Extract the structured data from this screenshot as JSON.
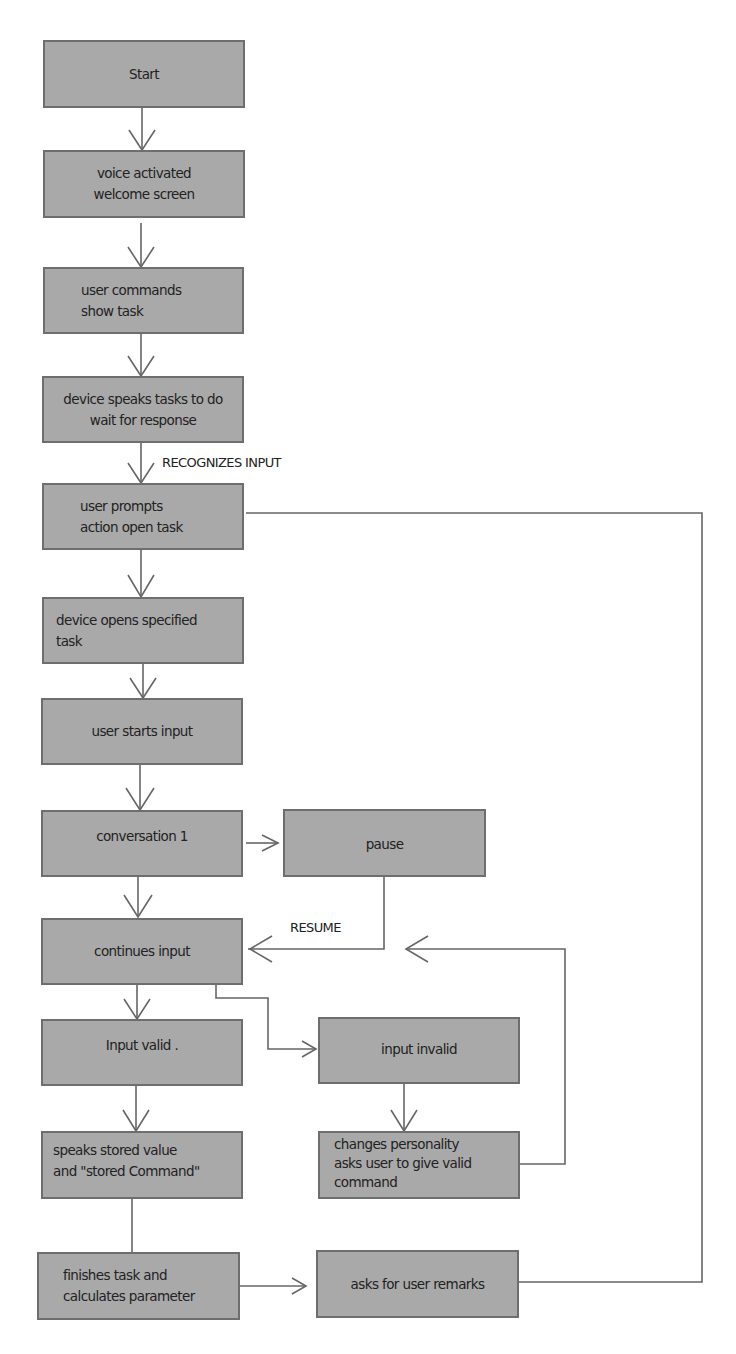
{
  "diagram": {
    "type": "flowchart",
    "colors": {
      "node_fill": "#a9a9a9",
      "node_border": "#6e6e6e",
      "connector": "#666666",
      "text": "#222222"
    },
    "nodes": {
      "start": "Start",
      "welcome": "voice activated\nwelcome screen",
      "user_commands": "user commands\nshow task",
      "device_speaks": "device speaks tasks to do\nwait for response",
      "user_prompts": "user prompts\naction open task",
      "device_opens": "device opens specified\ntask",
      "user_starts_input": "user starts input",
      "conversation": "conversation 1",
      "pause": "pause",
      "continues_input": "continues input",
      "input_valid": "Input valid .",
      "input_invalid": "input invalid",
      "speaks_stored": "speaks stored value\nand \"stored Command\"",
      "changes_personality": "changes personality\nasks user to give valid\ncommand",
      "finishes_task": "finishes task and\ncalculates parameter",
      "asks_remarks": "asks for user remarks"
    },
    "edge_labels": {
      "recognizes_input": "RECOGNIZES INPUT",
      "resume": "RESUME"
    },
    "edges": [
      {
        "from": "start",
        "to": "welcome"
      },
      {
        "from": "welcome",
        "to": "user_commands"
      },
      {
        "from": "user_commands",
        "to": "device_speaks"
      },
      {
        "from": "device_speaks",
        "to": "user_prompts",
        "label": "RECOGNIZES INPUT"
      },
      {
        "from": "user_prompts",
        "to": "device_opens"
      },
      {
        "from": "device_opens",
        "to": "user_starts_input"
      },
      {
        "from": "user_starts_input",
        "to": "conversation"
      },
      {
        "from": "conversation",
        "to": "pause"
      },
      {
        "from": "conversation",
        "to": "continues_input"
      },
      {
        "from": "pause",
        "to": "continues_input",
        "label": "RESUME"
      },
      {
        "from": "continues_input",
        "to": "input_valid"
      },
      {
        "from": "continues_input",
        "to": "input_invalid"
      },
      {
        "from": "input_invalid",
        "to": "changes_personality"
      },
      {
        "from": "changes_personality",
        "to": "continues_input"
      },
      {
        "from": "input_valid",
        "to": "speaks_stored"
      },
      {
        "from": "speaks_stored",
        "to": "finishes_task"
      },
      {
        "from": "finishes_task",
        "to": "asks_remarks"
      },
      {
        "from": "asks_remarks",
        "to": "user_prompts"
      }
    ]
  }
}
